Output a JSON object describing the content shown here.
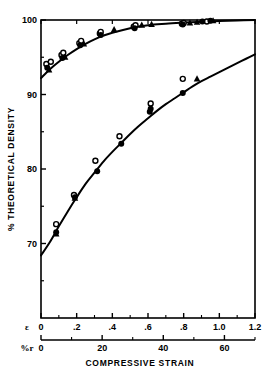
{
  "chart_data": {
    "type": "scatter",
    "title": "",
    "subtitle": "",
    "xlabel": "COMPRESSIVE STRAIN",
    "ylabel": "% THEORETICAL DENSITY",
    "xlim": [
      0,
      1.2
    ],
    "ylim": [
      60,
      100
    ],
    "grid": false,
    "legend_position": "none",
    "axes": {
      "primary_x": {
        "symbol": "ε",
        "ticks": [
          0,
          0.2,
          0.4,
          0.6,
          0.8,
          1.0,
          1.2
        ],
        "tick_labels": [
          "0",
          ".2",
          ".4",
          ".6",
          ".8",
          "1.0",
          "1.2"
        ],
        "minor_ticks": [
          0.1,
          0.3,
          0.5,
          0.7,
          0.9,
          1.1
        ]
      },
      "secondary_x": {
        "symbol": "%r",
        "ticks": [
          0,
          20,
          40,
          60
        ],
        "tick_labels": [
          "0",
          "20",
          "40",
          "60"
        ],
        "minor_ticks": [
          10,
          30,
          50,
          70
        ],
        "max": 70
      },
      "y": {
        "ticks": [
          70,
          80,
          90,
          100
        ],
        "tick_labels": [
          "70",
          "80",
          "90",
          "100"
        ],
        "minor_ticks": [
          65,
          75,
          85,
          95
        ]
      }
    },
    "series": [
      {
        "name": "upper-curve-circles",
        "marker": "open-circle",
        "points": [
          {
            "x": 0.03,
            "y": 94.1
          },
          {
            "x": 0.055,
            "y": 94.4
          },
          {
            "x": 0.115,
            "y": 95.3
          },
          {
            "x": 0.125,
            "y": 95.6
          },
          {
            "x": 0.215,
            "y": 96.9
          },
          {
            "x": 0.225,
            "y": 97.2
          },
          {
            "x": 0.33,
            "y": 98.2
          },
          {
            "x": 0.335,
            "y": 98.4
          },
          {
            "x": 0.52,
            "y": 99.1
          },
          {
            "x": 0.53,
            "y": 99.3
          },
          {
            "x": 0.79,
            "y": 99.5
          },
          {
            "x": 0.8,
            "y": 99.6
          },
          {
            "x": 0.93,
            "y": 99.8
          }
        ]
      },
      {
        "name": "upper-curve-filled",
        "marker": "filled-circle",
        "points": [
          {
            "x": 0.035,
            "y": 93.6
          },
          {
            "x": 0.12,
            "y": 94.9
          },
          {
            "x": 0.22,
            "y": 96.6
          },
          {
            "x": 0.335,
            "y": 98.0
          },
          {
            "x": 0.525,
            "y": 98.9
          },
          {
            "x": 0.795,
            "y": 99.4
          },
          {
            "x": 0.905,
            "y": 99.8
          },
          {
            "x": 0.95,
            "y": 99.9
          }
        ]
      },
      {
        "name": "upper-curve-triangles",
        "marker": "triangle",
        "points": [
          {
            "x": 0.045,
            "y": 93.3
          },
          {
            "x": 0.135,
            "y": 95.0
          },
          {
            "x": 0.24,
            "y": 96.8
          },
          {
            "x": 0.41,
            "y": 98.7
          },
          {
            "x": 0.565,
            "y": 99.3
          },
          {
            "x": 0.62,
            "y": 99.4
          },
          {
            "x": 0.835,
            "y": 99.6
          },
          {
            "x": 0.875,
            "y": 99.7
          },
          {
            "x": 0.965,
            "y": 99.9
          }
        ]
      },
      {
        "name": "lower-curve-circles",
        "marker": "open-circle",
        "points": [
          {
            "x": 0.085,
            "y": 72.6
          },
          {
            "x": 0.185,
            "y": 76.5
          },
          {
            "x": 0.305,
            "y": 81.1
          },
          {
            "x": 0.44,
            "y": 84.4
          },
          {
            "x": 0.615,
            "y": 88.8
          },
          {
            "x": 0.795,
            "y": 92.1
          }
        ]
      },
      {
        "name": "lower-curve-filled",
        "marker": "filled-circle",
        "points": [
          {
            "x": 0.085,
            "y": 71.5
          },
          {
            "x": 0.19,
            "y": 76.2
          },
          {
            "x": 0.315,
            "y": 79.7
          },
          {
            "x": 0.45,
            "y": 83.4
          },
          {
            "x": 0.61,
            "y": 87.7
          },
          {
            "x": 0.615,
            "y": 88.1
          },
          {
            "x": 0.795,
            "y": 90.2
          }
        ]
      },
      {
        "name": "lower-curve-triangles",
        "marker": "triangle",
        "points": [
          {
            "x": 0.085,
            "y": 71.3
          },
          {
            "x": 0.19,
            "y": 76.1
          },
          {
            "x": 0.875,
            "y": 92.1
          }
        ]
      }
    ],
    "fit_curves": [
      {
        "name": "upper-fit",
        "points": [
          {
            "x": 0.0,
            "y": 92.2
          },
          {
            "x": 0.05,
            "y": 93.4
          },
          {
            "x": 0.1,
            "y": 94.4
          },
          {
            "x": 0.15,
            "y": 95.3
          },
          {
            "x": 0.2,
            "y": 96.1
          },
          {
            "x": 0.25,
            "y": 96.8
          },
          {
            "x": 0.3,
            "y": 97.4
          },
          {
            "x": 0.35,
            "y": 97.9
          },
          {
            "x": 0.4,
            "y": 98.3
          },
          {
            "x": 0.5,
            "y": 98.9
          },
          {
            "x": 0.6,
            "y": 99.3
          },
          {
            "x": 0.7,
            "y": 99.5
          },
          {
            "x": 0.8,
            "y": 99.65
          },
          {
            "x": 0.9,
            "y": 99.78
          },
          {
            "x": 1.0,
            "y": 99.86
          },
          {
            "x": 1.1,
            "y": 99.93
          },
          {
            "x": 1.2,
            "y": 100.0
          }
        ]
      },
      {
        "name": "lower-fit",
        "points": [
          {
            "x": 0.0,
            "y": 68.4
          },
          {
            "x": 0.05,
            "y": 70.2
          },
          {
            "x": 0.1,
            "y": 72.3
          },
          {
            "x": 0.15,
            "y": 74.3
          },
          {
            "x": 0.2,
            "y": 76.2
          },
          {
            "x": 0.25,
            "y": 78.0
          },
          {
            "x": 0.3,
            "y": 79.5
          },
          {
            "x": 0.35,
            "y": 81.0
          },
          {
            "x": 0.4,
            "y": 82.3
          },
          {
            "x": 0.45,
            "y": 83.5
          },
          {
            "x": 0.5,
            "y": 84.7
          },
          {
            "x": 0.55,
            "y": 85.8
          },
          {
            "x": 0.6,
            "y": 86.8
          },
          {
            "x": 0.65,
            "y": 87.8
          },
          {
            "x": 0.7,
            "y": 88.7
          },
          {
            "x": 0.75,
            "y": 89.5
          },
          {
            "x": 0.8,
            "y": 90.3
          },
          {
            "x": 0.85,
            "y": 91.1
          },
          {
            "x": 0.9,
            "y": 91.8
          },
          {
            "x": 0.95,
            "y": 92.4
          },
          {
            "x": 1.0,
            "y": 93.0
          },
          {
            "x": 1.05,
            "y": 93.6
          },
          {
            "x": 1.1,
            "y": 94.2
          },
          {
            "x": 1.15,
            "y": 94.8
          },
          {
            "x": 1.2,
            "y": 95.4
          }
        ]
      }
    ]
  }
}
